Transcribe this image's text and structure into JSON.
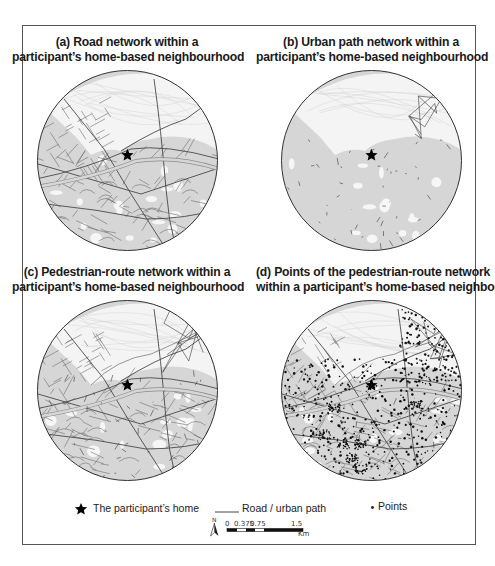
{
  "figure": {
    "panels": [
      {
        "id": "a",
        "title_line1": "(a) Road network within a",
        "title_line2": "participant’s home-based neighbourhood",
        "style": "roads"
      },
      {
        "id": "b",
        "title_line1": "(b) Urban path network within a",
        "title_line2": "participant’s home-based neighbourhood",
        "style": "paths"
      },
      {
        "id": "c",
        "title_line1": "(c) Pedestrian-route network within a",
        "title_line2": "participant’s home-based neighbourhood",
        "style": "pedestrian"
      },
      {
        "id": "d",
        "title_line1": "(d) Points of the pedestrian-route network",
        "title_line2": "within a participant’s home-based neighbourhod",
        "style": "points"
      }
    ],
    "legend": {
      "home_label": "The participant’s home",
      "road_label": "Road / urban path",
      "points_label": "Points",
      "north_label": "N",
      "scale_unit": "Km",
      "scale_ticks": [
        "0",
        "0.375",
        "0.75",
        "1.5"
      ]
    },
    "colors": {
      "border": "#555555",
      "land_fill": "#d6d6d6",
      "open_space": "#f4f4f4",
      "road": "#6e6e6e",
      "path": "#3a3a3a",
      "point": "#111111",
      "star": "#000000"
    }
  }
}
